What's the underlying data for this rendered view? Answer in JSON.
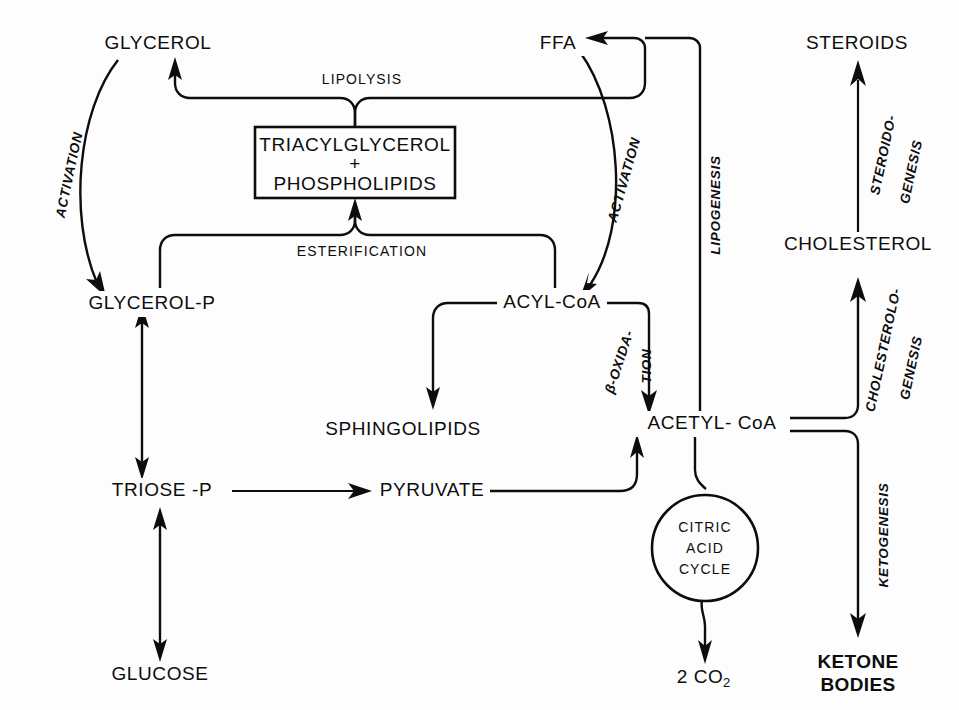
{
  "diagram": {
    "background_color": "#fdfdfd",
    "ink_color": "#0d0d0d",
    "nodes": {
      "glycerol": "GLYCEROL",
      "ffa": "FFA",
      "steroids": "STEROIDS",
      "triacylglycerol": "TRIACYLGLYCEROL",
      "plus": "+",
      "phospholipids": "PHOSPHOLIPIDS",
      "cholesterol": "CHOLESTEROL",
      "glycerol_p": "GLYCEROL-P",
      "acyl_coa": "ACYL-CoA",
      "sphingolipids": "SPHINGOLIPIDS",
      "acetyl_coa": "ACETYL- CoA",
      "triose_p": "TRIOSE -P",
      "pyruvate": "PYRUVATE",
      "glucose": "GLUCOSE",
      "citric_line1": "CITRIC",
      "citric_line2": "ACID",
      "citric_line3": "CYCLE",
      "co2": "2 CO",
      "co2_sub": "2",
      "ketone_line1": "KETONE",
      "ketone_line2": "BODIES"
    },
    "processes": {
      "lipolysis": "LIPOLYSIS",
      "esterification": "ESTERIFICATION",
      "activation_left": "ACTIVATION",
      "activation_right": "ACTIVATION",
      "lipogenesis": "LIPOGENESIS",
      "beta_oxidation_line1": "β-OXIDA-",
      "beta_oxidation_line2": "TION",
      "steroidogenesis_line1": "STEROIDO-",
      "steroidogenesis_line2": "GENESIS",
      "cholesterologenesis_line1": "CHOLESTEROLO-",
      "cholesterologenesis_line2": "GENESIS",
      "ketogenesis": "KETOGENESIS"
    }
  }
}
